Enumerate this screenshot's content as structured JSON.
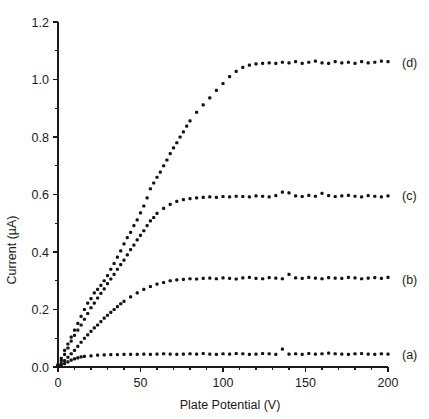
{
  "chart_data": {
    "type": "scatter",
    "title": "",
    "xlabel": "Plate Potential (V)",
    "ylabel": "Current (µA)",
    "xlim": [
      0,
      200
    ],
    "ylim": [
      0.0,
      1.2
    ],
    "xticks": [
      0,
      50,
      100,
      150,
      200
    ],
    "xticklabels": [
      "0",
      "50",
      "100",
      "150",
      "200"
    ],
    "xminor_tick_step": 10,
    "yticks": [
      0.0,
      0.2,
      0.4,
      0.6,
      0.8,
      1.0,
      1.2
    ],
    "yticklabels": [
      "0.0",
      "0.2",
      "0.4",
      "0.6",
      "0.8",
      "1.0",
      "1.2"
    ],
    "yminor_tick_step": 0.1,
    "grid": false,
    "legend_position": "right-inline",
    "marker": "square-dot",
    "marker_color": "#141414",
    "series": [
      {
        "name": "(a)",
        "label": "(a)",
        "label_x": 200,
        "label_y": 0.045,
        "saturation_value": 0.045,
        "x": [
          0,
          2,
          4,
          6,
          8,
          10,
          12,
          14,
          16,
          20,
          24,
          28,
          32,
          36,
          40,
          44,
          48,
          52,
          56,
          60,
          64,
          68,
          72,
          76,
          80,
          84,
          88,
          92,
          96,
          100,
          104,
          108,
          112,
          116,
          120,
          124,
          128,
          132,
          136,
          140,
          144,
          148,
          152,
          156,
          160,
          164,
          168,
          172,
          176,
          180,
          184,
          188,
          192,
          196,
          200
        ],
        "y": [
          0.002,
          0.006,
          0.012,
          0.018,
          0.024,
          0.028,
          0.032,
          0.035,
          0.037,
          0.039,
          0.041,
          0.042,
          0.043,
          0.043,
          0.044,
          0.044,
          0.044,
          0.045,
          0.044,
          0.045,
          0.046,
          0.045,
          0.044,
          0.045,
          0.046,
          0.045,
          0.047,
          0.045,
          0.044,
          0.046,
          0.045,
          0.047,
          0.046,
          0.044,
          0.045,
          0.047,
          0.046,
          0.044,
          0.062,
          0.045,
          0.046,
          0.044,
          0.047,
          0.045,
          0.046,
          0.048,
          0.046,
          0.045,
          0.044,
          0.046,
          0.047,
          0.045,
          0.044,
          0.046,
          0.045
        ]
      },
      {
        "name": "(b)",
        "label": "(b)",
        "label_x": 200,
        "label_y": 0.305,
        "saturation_value": 0.31,
        "x": [
          0,
          2,
          4,
          6,
          8,
          10,
          12,
          14,
          16,
          18,
          20,
          22,
          24,
          26,
          28,
          30,
          32,
          34,
          36,
          38,
          40,
          44,
          48,
          52,
          56,
          60,
          64,
          68,
          72,
          76,
          80,
          84,
          88,
          92,
          96,
          100,
          104,
          108,
          112,
          116,
          120,
          124,
          128,
          132,
          136,
          140,
          144,
          148,
          152,
          156,
          160,
          164,
          168,
          172,
          176,
          180,
          184,
          188,
          192,
          196,
          200
        ],
        "y": [
          0.004,
          0.012,
          0.022,
          0.034,
          0.046,
          0.058,
          0.072,
          0.086,
          0.1,
          0.112,
          0.124,
          0.136,
          0.146,
          0.158,
          0.17,
          0.18,
          0.19,
          0.2,
          0.21,
          0.22,
          0.228,
          0.244,
          0.258,
          0.27,
          0.28,
          0.288,
          0.294,
          0.3,
          0.303,
          0.305,
          0.307,
          0.306,
          0.308,
          0.309,
          0.307,
          0.31,
          0.308,
          0.306,
          0.31,
          0.312,
          0.308,
          0.307,
          0.311,
          0.309,
          0.307,
          0.322,
          0.31,
          0.308,
          0.312,
          0.309,
          0.307,
          0.311,
          0.309,
          0.308,
          0.312,
          0.31,
          0.307,
          0.309,
          0.311,
          0.308,
          0.312
        ]
      },
      {
        "name": "(c)",
        "label": "(c)",
        "label_x": 200,
        "label_y": 0.595,
        "saturation_value": 0.595,
        "x": [
          0,
          2,
          4,
          6,
          8,
          10,
          12,
          14,
          16,
          18,
          20,
          22,
          24,
          26,
          28,
          30,
          32,
          34,
          36,
          38,
          40,
          42,
          44,
          46,
          48,
          50,
          52,
          54,
          56,
          58,
          60,
          64,
          68,
          72,
          76,
          80,
          84,
          88,
          92,
          96,
          100,
          104,
          108,
          112,
          116,
          120,
          124,
          128,
          132,
          136,
          140,
          144,
          148,
          152,
          156,
          160,
          164,
          168,
          172,
          176,
          180,
          184,
          188,
          192,
          196,
          200
        ],
        "y": [
          0.006,
          0.022,
          0.044,
          0.066,
          0.09,
          0.11,
          0.128,
          0.146,
          0.166,
          0.186,
          0.206,
          0.222,
          0.24,
          0.256,
          0.272,
          0.29,
          0.306,
          0.322,
          0.34,
          0.356,
          0.372,
          0.39,
          0.408,
          0.424,
          0.442,
          0.458,
          0.474,
          0.492,
          0.508,
          0.52,
          0.534,
          0.552,
          0.566,
          0.576,
          0.582,
          0.586,
          0.588,
          0.59,
          0.592,
          0.59,
          0.593,
          0.592,
          0.594,
          0.593,
          0.592,
          0.595,
          0.594,
          0.592,
          0.596,
          0.608,
          0.606,
          0.595,
          0.593,
          0.597,
          0.594,
          0.604,
          0.596,
          0.593,
          0.595,
          0.597,
          0.594,
          0.592,
          0.596,
          0.594,
          0.592,
          0.595
        ]
      },
      {
        "name": "(d)",
        "label": "(d)",
        "label_x": 200,
        "label_y": 1.06,
        "saturation_value": 1.06,
        "x": [
          0,
          2,
          4,
          6,
          8,
          10,
          12,
          14,
          16,
          18,
          20,
          22,
          24,
          26,
          28,
          30,
          32,
          34,
          36,
          38,
          40,
          42,
          44,
          46,
          48,
          50,
          52,
          54,
          56,
          58,
          60,
          62,
          64,
          66,
          68,
          70,
          72,
          74,
          76,
          78,
          80,
          84,
          88,
          92,
          96,
          100,
          104,
          108,
          112,
          116,
          120,
          124,
          128,
          132,
          136,
          140,
          144,
          148,
          152,
          156,
          160,
          164,
          168,
          172,
          176,
          180,
          184,
          188,
          192,
          196,
          200
        ],
        "y": [
          0.008,
          0.03,
          0.058,
          0.08,
          0.104,
          0.128,
          0.152,
          0.176,
          0.2,
          0.222,
          0.238,
          0.258,
          0.27,
          0.284,
          0.3,
          0.318,
          0.34,
          0.36,
          0.382,
          0.404,
          0.428,
          0.45,
          0.468,
          0.492,
          0.512,
          0.536,
          0.56,
          0.588,
          0.62,
          0.64,
          0.66,
          0.678,
          0.7,
          0.72,
          0.742,
          0.762,
          0.78,
          0.8,
          0.818,
          0.838,
          0.856,
          0.886,
          0.912,
          0.936,
          0.962,
          0.986,
          1.01,
          1.028,
          1.042,
          1.05,
          1.054,
          1.056,
          1.058,
          1.056,
          1.06,
          1.058,
          1.062,
          1.056,
          1.06,
          1.064,
          1.058,
          1.056,
          1.062,
          1.058,
          1.06,
          1.056,
          1.062,
          1.058,
          1.06,
          1.064,
          1.062
        ]
      }
    ]
  },
  "figure": {
    "background_color": "#ffffff",
    "axis_color": "#1a1a1a",
    "marker_color": "#141414"
  }
}
